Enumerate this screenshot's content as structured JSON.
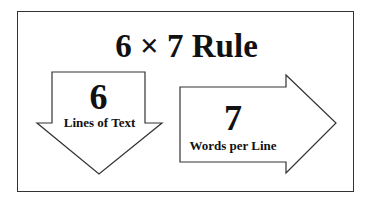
{
  "title": "6 × 7 Rule",
  "down_arrow": {
    "number": "6",
    "label": "Lines of Text"
  },
  "right_arrow": {
    "number": "7",
    "label": "Words per Line"
  },
  "colors": {
    "stroke": "#333333",
    "text": "#111111",
    "background": "#ffffff"
  }
}
